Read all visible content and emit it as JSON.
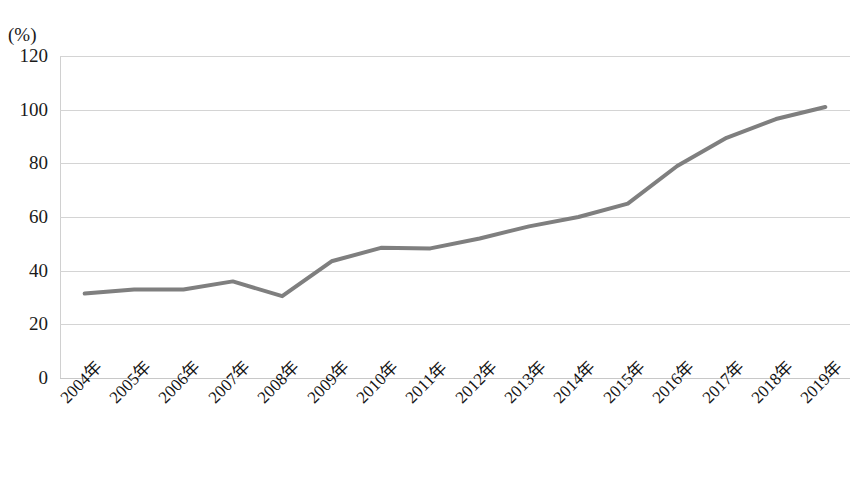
{
  "chart_data": {
    "type": "line",
    "title": "",
    "subtitle": "",
    "xlabel": "",
    "ylabel": "",
    "unit_label": "(%)",
    "categories": [
      "2004年",
      "2005年",
      "2006年",
      "2007年",
      "2008年",
      "2009年",
      "2010年",
      "2011年",
      "2012年",
      "2013年",
      "2014年",
      "2015年",
      "2016年",
      "2017年",
      "2018年",
      "2019年"
    ],
    "values": [
      31.5,
      33.0,
      33.0,
      36.0,
      30.5,
      43.5,
      48.5,
      48.3,
      52.0,
      56.5,
      60.0,
      65.0,
      79.0,
      89.5,
      96.5,
      101.0
    ],
    "series": [
      {
        "name": "",
        "values": [
          31.5,
          33.0,
          33.0,
          36.0,
          30.5,
          43.5,
          48.5,
          48.3,
          52.0,
          56.5,
          60.0,
          65.0,
          79.0,
          89.5,
          96.5,
          101.0
        ],
        "color": "#7f7f7f"
      }
    ],
    "ylim": [
      0,
      120
    ],
    "yticks": [
      0,
      20,
      40,
      60,
      80,
      100,
      120
    ],
    "ytick_labels": [
      "0",
      "20",
      "40",
      "60",
      "80",
      "100",
      "120"
    ],
    "grid": true,
    "grid_axis": "y",
    "legend": false,
    "legend_position": "none",
    "line_color": "#7f7f7f",
    "line_width": 4,
    "markers": false,
    "background_color": "#ffffff",
    "grid_color": "#d4d4d4",
    "xtick_rotation": -45
  }
}
